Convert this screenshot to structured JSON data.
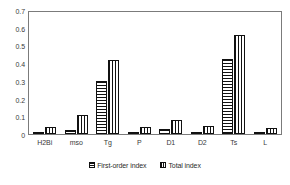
{
  "chart_data": {
    "type": "bar",
    "title": "",
    "subtitle": "",
    "xlabel": "",
    "ylabel": "",
    "ylim": [
      0,
      0.7
    ],
    "ytick_labels": [
      "0.7",
      "0.6",
      "0.5",
      "0.4",
      "0.3",
      "0.2",
      "0.1",
      "0"
    ],
    "ytick_values": [
      0.7,
      0.6,
      0.5,
      0.4,
      0.3,
      0.2,
      0.1,
      0
    ],
    "grid": false,
    "legend_position": "bottom-center",
    "categories": [
      "H2Bi",
      "mso",
      "Tg",
      "P",
      "D1",
      "D2",
      "Ts",
      "L"
    ],
    "series": [
      {
        "name": "First-order index",
        "pattern": "horizontal-stripes",
        "color": "#111111",
        "values": [
          0.003,
          0.025,
          0.305,
          0.003,
          0.03,
          0.004,
          0.43,
          0.002
        ]
      },
      {
        "name": "Total index",
        "pattern": "vertical-stripes",
        "color": "#111111",
        "values": [
          0.04,
          0.11,
          0.425,
          0.04,
          0.08,
          0.045,
          0.57,
          0.035
        ]
      }
    ]
  },
  "legend": {
    "items": [
      {
        "label": "First-order index",
        "pattern": "horizontal-stripes"
      },
      {
        "label": "Total index",
        "pattern": "vertical-stripes"
      }
    ]
  },
  "caption_sliver": {
    "text": ""
  }
}
